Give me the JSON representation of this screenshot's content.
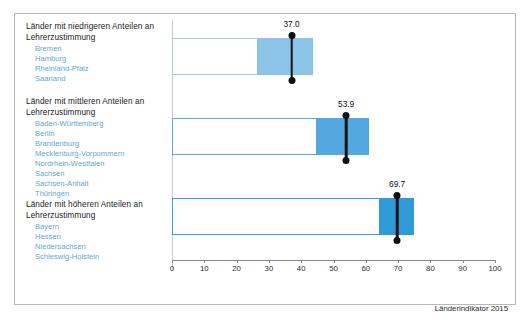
{
  "chart_data": {
    "type": "bar",
    "title": "",
    "subtitle": "",
    "xlabel": "",
    "ylabel": "",
    "xlim": [
      0,
      100
    ],
    "ylim": null,
    "grid": false,
    "legend": null,
    "source_note": "Länderindikator 2015",
    "xticks": [
      0,
      10,
      20,
      30,
      40,
      50,
      60,
      70,
      80,
      90,
      100
    ],
    "xticklabels": [
      "0",
      "10",
      "20",
      "30",
      "40",
      "50",
      "60",
      "70",
      "80",
      "90",
      "100"
    ],
    "categories": [
      "Länder mit niedrigeren Anteilen an Lehrerzustimmung",
      "Länder mit mittleren Anteilen an Lehrerzustimmung",
      "Länder mit höheren Anteilen an Lehrerzustimmung"
    ],
    "series": [
      {
        "name": "Box (Bereich)",
        "boxes": [
          {
            "low": 0.0,
            "high": 43.6
          },
          {
            "low": 0.0,
            "high": 61.0
          },
          {
            "low": 0.0,
            "high": 75.0
          }
        ]
      },
      {
        "name": "Gefüllter Bereich",
        "fills": [
          {
            "from": 26.3,
            "to": 43.6
          },
          {
            "from": 44.6,
            "to": 61.0
          },
          {
            "from": 64.0,
            "to": 75.0
          }
        ]
      }
    ],
    "markers": [
      {
        "value": 37.0,
        "label": "37.0"
      },
      {
        "value": 53.9,
        "label": "53.9"
      },
      {
        "value": 69.7,
        "label": "69.7"
      }
    ],
    "colors": {
      "fill_low": "#8cc4e8",
      "fill_mid": "#53a9df",
      "fill_high": "#2e9ad6",
      "outline_low": "#9fcdea",
      "outline_mid": "#5fa7d6",
      "outline_high": "#3a9fd8",
      "marker": "#111111",
      "axis": "#8a8a8a",
      "state_text": "#5fa7d6",
      "heading_text": "#1a1a1a"
    }
  },
  "groups": [
    {
      "heading": "Länder mit niedrigeren Anteilen an Lehrerzustimmung",
      "states": [
        "Bremen",
        "Hamburg",
        "Rheinland-Pfalz",
        "Saarland"
      ]
    },
    {
      "heading": "Länder mit mittleren Anteilen an Lehrerzustimmung",
      "states": [
        "Baden-Württemberg",
        "Berlin",
        "Brandenburg",
        "Mecklenburg-Vorpommern",
        "Nordrhein-Westfalen",
        "Sachsen",
        "Sachsen-Anhalt",
        "Thüringen"
      ]
    },
    {
      "heading": "Länder mit höheren Anteilen an Lehrerzustimmung",
      "states": [
        "Bayern",
        "Hessen",
        "Niedersachsen",
        "Schleswig-Holstein"
      ]
    }
  ],
  "footer": {
    "credit": "Länderindikator 2015"
  }
}
